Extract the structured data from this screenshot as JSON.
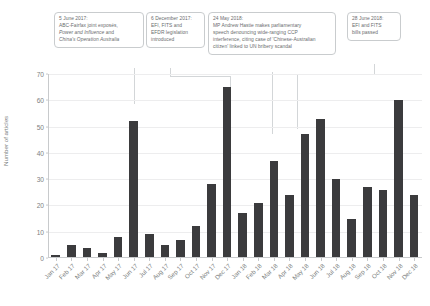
{
  "chart_data": {
    "type": "bar",
    "title": "",
    "xlabel": "",
    "ylabel": "Number of articles",
    "ylim": [
      0,
      70
    ],
    "yticks": [
      0,
      10,
      20,
      30,
      40,
      50,
      60,
      70
    ],
    "grid": true,
    "legend": "none",
    "bar_color": "#3b3b3d",
    "categories": [
      "Jan 17",
      "Feb 17",
      "Mar 17",
      "Apr 17",
      "May 17",
      "Jun 17",
      "Jul 17",
      "Aug 17",
      "Sep 17",
      "Oct 17",
      "Nov 17",
      "Dec 17",
      "Jan 18",
      "Feb 18",
      "Mar 18",
      "Apr 18",
      "May 18",
      "Jun 18",
      "Jul 18",
      "Aug 18",
      "Sep 18",
      "Oct 18",
      "Nov 18",
      "Dec 18"
    ],
    "values": [
      1,
      5,
      4,
      2,
      8,
      52,
      9,
      5,
      7,
      12,
      28,
      65,
      17,
      21,
      37,
      24,
      47,
      53,
      30,
      15,
      27,
      26,
      60,
      24
    ]
  },
  "annotations": [
    {
      "id": "annotation-2017-06-05",
      "lines": [
        {
          "text": "5 June 2017:",
          "italic": false
        },
        {
          "text": "ABC-Fairfax joint exposés,",
          "italic": false
        },
        {
          "text": "Power and Influence",
          "italic": true,
          "suffix": " and"
        },
        {
          "text": "China's Operation Australia",
          "italic": true
        }
      ],
      "target_category": "Jun 17"
    },
    {
      "id": "annotation-2017-12-06",
      "lines": [
        {
          "text": "6 December 2017:",
          "italic": false
        },
        {
          "text": "EFI, FITS and",
          "italic": false
        },
        {
          "text": "EFDR legislation",
          "italic": false
        },
        {
          "text": "introduced",
          "italic": false
        }
      ],
      "target_category": "Dec 17"
    },
    {
      "id": "annotation-2018-05-24",
      "lines": [
        {
          "text": "24 May 2018:",
          "italic": false
        },
        {
          "text": "MP Andrew Hastie makes parliamentary",
          "italic": false
        },
        {
          "text": "speech denouncing wide-ranging CCP",
          "italic": false
        },
        {
          "text": "interference, citing case of 'Chinese-Australian",
          "italic": false
        },
        {
          "text": "citizen' linked to UN bribery scandal",
          "italic": false
        }
      ],
      "target_category": "May 18"
    },
    {
      "id": "annotation-2018-06-28",
      "lines": [
        {
          "text": "28 June 2018:",
          "italic": false
        },
        {
          "text": "EFI and FITS",
          "italic": false
        },
        {
          "text": "bills passed",
          "italic": false
        }
      ],
      "target_category": "Jun 18"
    }
  ]
}
